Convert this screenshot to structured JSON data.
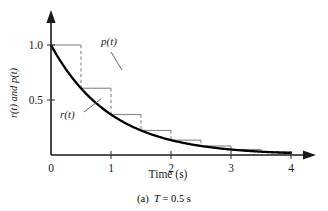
{
  "figure": {
    "caption_prefix": "(a)",
    "caption_symbol": "T",
    "caption_rest": "= 0.5 s",
    "caption_full": "(a)  T = 0.5 s"
  },
  "labels": {
    "p_label": "p(t)",
    "r_label": "r(t)",
    "y_axis_title": "r(t) and p(t)",
    "x_axis_title": "Time (s)"
  },
  "colors": {
    "curve": "#000000",
    "stair": "#8a8a8a",
    "axis": "#1a1a1a",
    "background": "#ffffff"
  },
  "chart_data": {
    "type": "line",
    "title": "",
    "xlabel": "Time (s)",
    "ylabel": "r(t) and p(t)",
    "xlim": [
      0,
      4
    ],
    "ylim": [
      0,
      1.08
    ],
    "xticks": [
      0,
      1,
      2,
      3,
      4
    ],
    "xtick_labels": [
      "0",
      "1",
      "2",
      "3",
      "4"
    ],
    "yticks": [
      0.5,
      1.0
    ],
    "ytick_labels": [
      "0.5",
      "1.0"
    ],
    "grid": false,
    "legend": "inline-annotations",
    "sample_period": 0.5,
    "series": [
      {
        "name": "r(t)",
        "kind": "continuous-exponential",
        "formula": "exp(-t)",
        "x": [
          0,
          0.25,
          0.5,
          0.75,
          1,
          1.25,
          1.5,
          1.75,
          2,
          2.25,
          2.5,
          2.75,
          3,
          3.25,
          3.5,
          3.75,
          4
        ],
        "values": [
          1.0,
          0.779,
          0.607,
          0.472,
          0.368,
          0.287,
          0.223,
          0.174,
          0.135,
          0.105,
          0.082,
          0.064,
          0.05,
          0.039,
          0.03,
          0.024,
          0.018
        ]
      },
      {
        "name": "p(t)",
        "kind": "zero-order-hold-staircase",
        "x_left_edges": [
          0,
          0.5,
          1.0,
          1.5,
          2.0,
          2.5,
          3.0,
          3.5
        ],
        "x_right_edges": [
          0.5,
          1.0,
          1.5,
          2.0,
          2.5,
          3.0,
          3.5,
          4.0
        ],
        "values": [
          1.0,
          0.607,
          0.368,
          0.223,
          0.135,
          0.082,
          0.05,
          0.03
        ]
      }
    ],
    "annotations": [
      {
        "text": "p(t)",
        "target_series": "p(t)",
        "at_x": 0.95,
        "at_y": 0.62
      },
      {
        "text": "r(t)",
        "target_series": "r(t)",
        "at_x": 0.62,
        "at_y": 0.4
      }
    ]
  }
}
